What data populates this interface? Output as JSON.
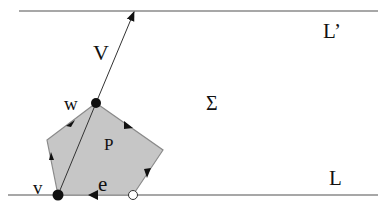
{
  "diagram": {
    "colors": {
      "line": "#8a8a8a",
      "polygon_fill": "#c6c6c6",
      "polygon_stroke": "#8a8a8a",
      "ink": "#111111",
      "open_point_fill": "#ffffff"
    },
    "lines": {
      "top": {
        "label": "L’"
      },
      "bottom": {
        "label": "L"
      }
    },
    "region": {
      "label": "Σ"
    },
    "polygon": {
      "label": "P"
    },
    "vector": {
      "label": "V"
    },
    "vertices": {
      "w": {
        "label": "w"
      },
      "v": {
        "label": "v"
      }
    },
    "edge": {
      "label": "e"
    }
  }
}
